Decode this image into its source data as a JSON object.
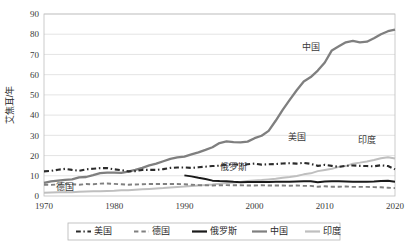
{
  "chart_data": {
    "type": "line",
    "title": "",
    "subtitle": "",
    "xlabel": "",
    "ylabel": "艾焦耳/年",
    "xlim": [
      1970,
      2020
    ],
    "ylim": [
      0,
      90
    ],
    "ytick_step": 10,
    "grid": true,
    "legend_position": "bottom",
    "xticks": [
      "1970",
      "1980",
      "1990",
      "2000",
      "2010",
      "2020"
    ],
    "yticks": [
      "0",
      "10",
      "20",
      "30",
      "40",
      "50",
      "60",
      "70",
      "80",
      "90"
    ],
    "x": [
      1970,
      1971,
      1972,
      1973,
      1974,
      1975,
      1976,
      1977,
      1978,
      1979,
      1980,
      1981,
      1982,
      1983,
      1984,
      1985,
      1986,
      1987,
      1988,
      1989,
      1990,
      1991,
      1992,
      1993,
      1994,
      1995,
      1996,
      1997,
      1998,
      1999,
      2000,
      2001,
      2002,
      2003,
      2004,
      2005,
      2006,
      2007,
      2008,
      2009,
      2010,
      2011,
      2012,
      2013,
      2014,
      2015,
      2016,
      2017,
      2018,
      2019,
      2020
    ],
    "series": [
      {
        "name": "美国",
        "color": "#2b2b2b",
        "style": "dash-dot",
        "width": 2.1,
        "label_in_chart": "美国",
        "label_x": 2006,
        "label_y": 27.5,
        "values": [
          12.2,
          12.4,
          13.0,
          13.4,
          12.9,
          12.5,
          13.2,
          13.5,
          13.8,
          13.8,
          13.2,
          12.8,
          12.2,
          12.3,
          12.9,
          12.9,
          12.9,
          13.3,
          13.9,
          14.1,
          14.1,
          13.9,
          14.2,
          14.5,
          14.8,
          15.0,
          15.5,
          15.6,
          15.5,
          15.7,
          16.0,
          15.5,
          15.7,
          15.8,
          16.1,
          16.2,
          16.0,
          16.4,
          15.9,
          14.9,
          15.4,
          14.9,
          14.4,
          14.9,
          15.1,
          14.9,
          14.8,
          14.7,
          15.2,
          14.8,
          13.2
        ]
      },
      {
        "name": "德国",
        "color": "#808080",
        "style": "dashed",
        "width": 1.9,
        "label_in_chart": "德国",
        "label_x": 1973,
        "label_y": 3.2,
        "values": [
          5.6,
          5.5,
          5.7,
          6.0,
          5.8,
          5.6,
          5.9,
          5.8,
          6.1,
          6.2,
          6.0,
          5.8,
          5.6,
          5.7,
          5.8,
          5.9,
          5.9,
          5.9,
          5.9,
          5.9,
          5.8,
          5.6,
          5.4,
          5.3,
          5.2,
          5.3,
          5.4,
          5.3,
          5.3,
          5.2,
          5.2,
          5.3,
          5.2,
          5.2,
          5.2,
          5.1,
          5.2,
          5.0,
          5.0,
          4.6,
          4.8,
          4.6,
          4.6,
          4.7,
          4.5,
          4.5,
          4.5,
          4.4,
          4.3,
          4.1,
          3.9
        ]
      },
      {
        "name": "俄罗斯",
        "color": "#1a1a1a",
        "style": "solid",
        "width": 2.0,
        "label_in_chart": "俄罗斯",
        "label_x": 1997,
        "label_y": 12.8,
        "start_year": 1990,
        "values": [
          null,
          null,
          null,
          null,
          null,
          null,
          null,
          null,
          null,
          null,
          null,
          null,
          null,
          null,
          null,
          null,
          null,
          null,
          null,
          null,
          10.2,
          9.7,
          9.0,
          8.4,
          7.6,
          7.4,
          7.3,
          7.0,
          6.8,
          6.9,
          6.9,
          6.9,
          6.9,
          7.0,
          7.0,
          7.0,
          7.2,
          7.3,
          7.3,
          6.8,
          7.2,
          7.3,
          7.3,
          7.2,
          7.1,
          7.0,
          7.1,
          7.2,
          7.4,
          7.5,
          7.1
        ]
      },
      {
        "name": "中国",
        "color": "#7f7f7f",
        "style": "solid",
        "width": 2.3,
        "label_in_chart": "中国",
        "label_x": 2008,
        "label_y": 72.0,
        "values": [
          6.5,
          7.2,
          7.6,
          8.0,
          8.2,
          9.2,
          9.4,
          10.3,
          11.3,
          11.6,
          11.6,
          11.4,
          12.1,
          12.9,
          13.9,
          15.1,
          16.0,
          17.2,
          18.4,
          19.1,
          19.5,
          20.6,
          21.6,
          22.8,
          24.1,
          26.2,
          27.0,
          26.6,
          26.5,
          26.9,
          28.6,
          29.8,
          32.2,
          37.2,
          42.6,
          47.5,
          52.3,
          56.6,
          58.8,
          62.0,
          66.0,
          72.0,
          74.0,
          76.0,
          76.7,
          76.0,
          76.3,
          78.0,
          80.0,
          81.5,
          82.3
        ]
      },
      {
        "name": "印度",
        "color": "#bfbfbf",
        "style": "solid",
        "width": 2.0,
        "label_in_chart": "印度",
        "label_x": 2016,
        "label_y": 26.0,
        "values": [
          1.6,
          1.7,
          1.8,
          1.8,
          1.9,
          2.1,
          2.2,
          2.3,
          2.4,
          2.5,
          2.6,
          2.8,
          2.9,
          3.1,
          3.3,
          3.5,
          3.7,
          3.9,
          4.2,
          4.5,
          4.7,
          5.0,
          5.2,
          5.4,
          5.7,
          6.1,
          6.4,
          6.7,
          6.9,
          7.4,
          7.7,
          7.9,
          8.2,
          8.5,
          9.0,
          9.4,
          9.9,
          10.7,
          11.2,
          12.3,
          12.9,
          13.5,
          14.4,
          14.8,
          16.0,
          16.5,
          17.1,
          17.8,
          18.7,
          19.2,
          18.6
        ]
      }
    ]
  },
  "legend": {
    "items": [
      {
        "label": "美国",
        "color": "#2b2b2b",
        "style": "dash-dot"
      },
      {
        "label": "德国",
        "color": "#808080",
        "style": "dashed"
      },
      {
        "label": "俄罗斯",
        "color": "#1a1a1a",
        "style": "solid"
      },
      {
        "label": "中国",
        "color": "#7f7f7f",
        "style": "solid"
      },
      {
        "label": "印度",
        "color": "#bfbfbf",
        "style": "solid"
      }
    ]
  }
}
